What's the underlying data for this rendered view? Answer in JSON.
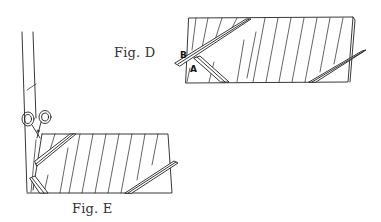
{
  "figures": {
    "fig_d": {
      "caption": "Fig. D",
      "labels": {
        "b": "B",
        "a": "A"
      }
    },
    "fig_e": {
      "caption": "Fig. E"
    }
  },
  "colors": {
    "line": "#222222",
    "background": "#ffffff"
  }
}
